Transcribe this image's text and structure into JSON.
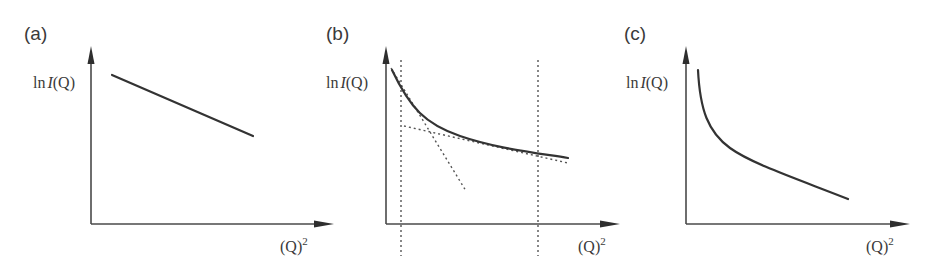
{
  "figure": {
    "panels": [
      {
        "id": "a",
        "label": "(a)",
        "y_axis_label": {
          "prefix": "ln",
          "italic": "I",
          "suffix": "(Q)"
        },
        "x_axis_label": {
          "base": "(Q)",
          "exponent": "2"
        },
        "description": "Straight line, linear decrease of ln I(Q) vs Q²"
      },
      {
        "id": "b",
        "label": "(b)",
        "y_axis_label": {
          "prefix": "ln",
          "italic": "I",
          "suffix": "(Q)"
        },
        "x_axis_label": {
          "base": "(Q)",
          "exponent": "2"
        },
        "description": "Convex decaying curve with two dotted tangent lines (steep at low Q², shallow at high Q²) and two vertical dotted lines bounding the range"
      },
      {
        "id": "c",
        "label": "(c)",
        "y_axis_label": {
          "prefix": "ln",
          "italic": "I",
          "suffix": "(Q)"
        },
        "x_axis_label": {
          "base": "(Q)",
          "exponent": "2"
        },
        "description": "Steeply decaying convex curve flattening at larger Q²"
      }
    ]
  },
  "colors": {
    "axis": "#4a4a4a",
    "curve": "#333333",
    "dotted": "#555555",
    "text": "#3a3a3a",
    "background": "#ffffff"
  }
}
